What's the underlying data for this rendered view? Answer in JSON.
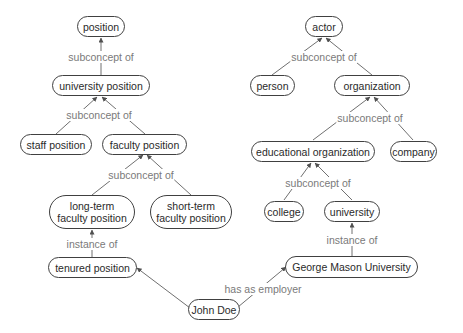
{
  "diagram": {
    "type": "concept-map",
    "colors": {
      "node_border": "#404040",
      "edge": "#707070",
      "edge_label": "#7a7a7a",
      "node_text": "#2a2a2a"
    },
    "nodes": {
      "position": "position",
      "university_position": "university position",
      "staff_position": "staff position",
      "faculty_position": "faculty position",
      "long_term_faculty_position": "long-term\nfaculty position",
      "short_term_faculty_position": "short-term\nfaculty position",
      "tenured_position": "tenured position",
      "john_doe": "John Doe",
      "actor": "actor",
      "person": "person",
      "organization": "organization",
      "educational_organization": "educational organization",
      "company": "company",
      "college": "college",
      "university": "university",
      "george_mason_university": "George Mason University"
    },
    "edge_labels": {
      "university_position_to_position": "subconcept of",
      "staff_faculty_to_university_position": "subconcept of",
      "long_short_to_faculty_position": "subconcept of",
      "tenured_to_long_term": "instance of",
      "john_to_tenured": "has as position",
      "john_to_gmu": "has as employer",
      "person_org_to_actor": "subconcept of",
      "edu_company_to_organization": "subconcept of",
      "college_university_to_edu": "subconcept of",
      "gmu_to_university": "instance of"
    }
  }
}
